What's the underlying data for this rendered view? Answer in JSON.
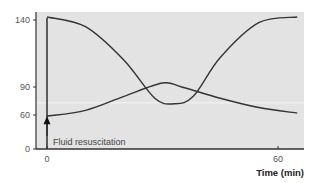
{
  "chart_data": {
    "type": "line",
    "title": "",
    "xlabel": "Time (min)",
    "ylabel": "",
    "xlim": [
      -3,
      67
    ],
    "ylim": [
      0,
      145
    ],
    "x_ticks": [
      0,
      60
    ],
    "x_tick_labels": [
      "0",
      "60"
    ],
    "y_ticks": [
      0,
      60,
      90,
      140
    ],
    "y_tick_labels": [
      "0",
      "60",
      "90",
      "140"
    ],
    "y_axis_scale": "schematic (non-linear spacing)",
    "grid": false,
    "reference_line": {
      "y": 73,
      "color": "#f2f2f2"
    },
    "background_color": "#e3e3e3",
    "line_color": "#333333",
    "series": [
      {
        "name": "descending-then-rising curve",
        "x": [
          0,
          10,
          20,
          28,
          33,
          38,
          45,
          55,
          65
        ],
        "y": [
          143,
          135,
          110,
          78,
          72,
          80,
          112,
          138,
          143
        ]
      },
      {
        "name": "rising-then-falling curve",
        "x": [
          0,
          10,
          20,
          30,
          35,
          45,
          55,
          65
        ],
        "y": [
          58,
          65,
          80,
          93,
          90,
          78,
          68,
          62
        ]
      }
    ],
    "annotations": [
      {
        "text": "Fluid resuscitation",
        "x": 0,
        "arrow": "up",
        "arrow_tip_y": 58
      }
    ],
    "legend": "none"
  }
}
